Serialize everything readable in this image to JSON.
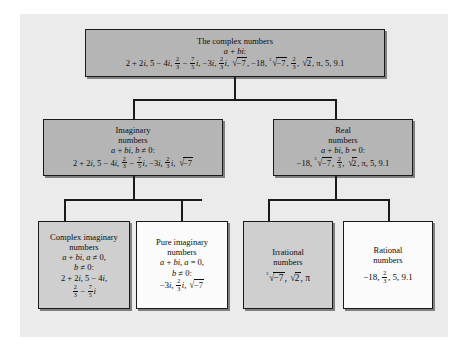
{
  "diagram": {
    "colors": {
      "panel_background": "#ebebeb",
      "box_dark": "#b5b5b5",
      "box_mid": "#cfcfcf",
      "box_light": "#fbfbfb",
      "border": "#1a1a1a",
      "text": "#0d0d0d"
    },
    "nodes": {
      "complex": {
        "title_line1": "The complex numbers",
        "form": "a + bi:",
        "examples_text": "2 + 2i, 5 − 4i, 2/3 − 7/5 i, −3i, 2/3 i, √−7, −18, ∛−7, 2/3, √2, π, 5, 9.1"
      },
      "imaginary": {
        "title_line1": "Imaginary",
        "title_line2": "numbers",
        "form": "a + bi, b ≠ 0:",
        "examples_text": "2 + 2i, 5 − 4i, 2/3 − 7/5 i, −3i, 2/3 i, √−7"
      },
      "real": {
        "title_line1": "Real",
        "title_line2": "numbers",
        "form": "a + bi, b = 0:",
        "examples_text": "−18, ∛−7, 2/3, √2, π, 5, 9.1"
      },
      "complex_imaginary": {
        "title_line1": "Complex imaginary",
        "title_line2": "numbers",
        "form_line1": "a + bi, a ≠ 0,",
        "form_line2": "b ≠ 0:",
        "examples_text": "2 + 2i, 5 − 4i, 2/3 − 7/5 i"
      },
      "pure_imaginary": {
        "title_line1": "Pure imaginary",
        "title_line2": "numbers",
        "form_line1": "a + bi, a = 0,",
        "form_line2": "b ≠ 0:",
        "examples_text": "−3i, 2/3 i, √−7"
      },
      "irrational": {
        "title_line1": "Irrational",
        "title_line2": "numbers",
        "examples_text": "∛−7, √2, π"
      },
      "rational": {
        "title_line1": "Rational",
        "title_line2": "numbers",
        "examples_text": "−18, 2/3, 5, 9.1"
      }
    }
  }
}
